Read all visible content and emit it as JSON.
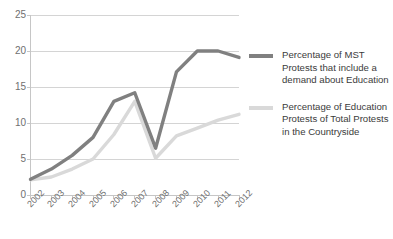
{
  "chart_data": {
    "type": "line",
    "title": "",
    "xlabel": "",
    "ylabel": "",
    "categories": [
      "2002",
      "2003",
      "2004",
      "2005",
      "2006",
      "2007",
      "2008",
      "2009",
      "2010",
      "2011",
      "2012"
    ],
    "x": [
      2002,
      2003,
      2004,
      2005,
      2006,
      2007,
      2008,
      2009,
      2010,
      2011,
      2012
    ],
    "ylim": [
      0,
      25
    ],
    "yticks": [
      0,
      5,
      10,
      15,
      20,
      25
    ],
    "ytick_labels": [
      "0",
      "5",
      "10",
      "15",
      "20",
      "25"
    ],
    "grid": "horizontal",
    "legend_position": "right",
    "series": [
      {
        "name": "Percentage of MST Protests that include a demand about Education",
        "color": "#808080",
        "values": [
          2.2,
          3.6,
          5.5,
          8.0,
          13.0,
          14.2,
          6.5,
          17.1,
          20.0,
          20.0,
          19.1
        ]
      },
      {
        "name": "Percentage of Education Protests of Total Protests in the Countryside",
        "color": "#d9d9d9",
        "values": [
          2.1,
          2.5,
          3.6,
          5.0,
          8.4,
          13.0,
          5.1,
          8.2,
          9.3,
          10.4,
          11.2
        ]
      }
    ]
  },
  "legend": {
    "entries": [
      {
        "label": "Percentage of MST Protests that include a demand about Education",
        "swatch_color": "#808080"
      },
      {
        "label": "Percentage of Education Protests of Total Protests in the Countryside",
        "swatch_color": "#d9d9d9"
      }
    ]
  },
  "axes": {
    "y_axis_color": "#c6c6c6",
    "x_axis_color": "#c6c6c6",
    "gridline_color": "#d4d4d4"
  }
}
